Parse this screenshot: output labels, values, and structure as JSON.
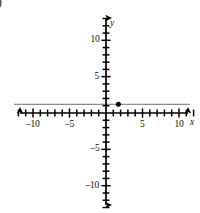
{
  "figure": {
    "corner_glyph": ")",
    "background_color": "#ffffff"
  },
  "axes": {
    "x_axis_name": "x",
    "y_axis_name": "y",
    "axis_color": "#000000",
    "x_tick_labels": [
      {
        "value": -10,
        "text": "–10"
      },
      {
        "value": -5,
        "text": "–5"
      },
      {
        "value": 5,
        "text": "5"
      },
      {
        "value": 10,
        "text": "10"
      }
    ],
    "y_tick_labels": [
      {
        "value": 10,
        "text": "10"
      },
      {
        "value": 5,
        "text": "5"
      },
      {
        "value": -5,
        "text": "–5"
      },
      {
        "value": -10,
        "text": "–10"
      }
    ]
  },
  "chart_data": {
    "type": "line",
    "title": "",
    "xlabel": "x",
    "ylabel": "y",
    "xlim": [
      -12.5,
      12.5
    ],
    "ylim": [
      -13.5,
      13.5
    ],
    "xticks": [
      -12,
      -11,
      -10,
      -9,
      -8,
      -7,
      -6,
      -5,
      -4,
      -3,
      -2,
      -1,
      1,
      2,
      3,
      4,
      5,
      6,
      7,
      8,
      9,
      10,
      11,
      12
    ],
    "yticks": [
      -13,
      -12,
      -11,
      -10,
      -9,
      -8,
      -7,
      -6,
      -5,
      -4,
      -3,
      -2,
      -1,
      1,
      2,
      3,
      4,
      5,
      6,
      7,
      8,
      9,
      10,
      11,
      12,
      13
    ],
    "xtick_labels": [
      "-10",
      "-5",
      "5",
      "10"
    ],
    "ytick_labels": [
      "10",
      "5",
      "-5",
      "-10"
    ],
    "grid": false,
    "legend": false,
    "series": [
      {
        "name": "horizontal-line",
        "type": "line",
        "color": "#8c8c8c",
        "equation": "y = 1.2",
        "x": [
          -12.6,
          11.5
        ],
        "values": [
          1.2,
          1.2
        ]
      },
      {
        "name": "plotted-point",
        "type": "scatter",
        "color": "#000000",
        "x": [
          1.7
        ],
        "values": [
          1.2
        ],
        "point_label": ""
      }
    ]
  }
}
